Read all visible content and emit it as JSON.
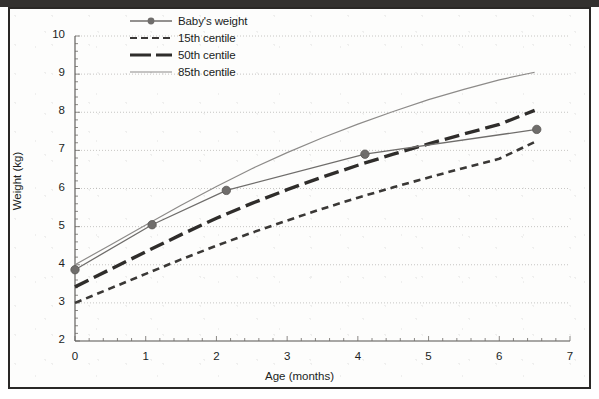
{
  "figure": {
    "frame_color": "#2a2826",
    "background": "#fdfdfc"
  },
  "chart_data": {
    "type": "line",
    "title": "",
    "subtitle": "",
    "xlabel": "Age (months)",
    "ylabel": "Weight (kg)",
    "xlim": [
      0,
      7
    ],
    "ylim": [
      2,
      10
    ],
    "xticks": [
      "0",
      "1",
      "2",
      "3",
      "4",
      "5",
      "6",
      "7"
    ],
    "yticks": [
      "2",
      "3",
      "4",
      "5",
      "6",
      "7",
      "8",
      "9",
      "10"
    ],
    "grid": "horizontal",
    "legend_position": "top-left-inside",
    "series": [
      {
        "name": "Baby's weight",
        "style": "solid-with-markers",
        "color": "#6f6d6b",
        "marker": "filled-circle",
        "x": [
          0.0,
          1.09,
          2.14,
          4.1,
          6.53
        ],
        "y": [
          3.87,
          5.05,
          5.95,
          6.9,
          7.55
        ]
      },
      {
        "name": "15th centile",
        "style": "short-dashed",
        "color": "#3a3836",
        "marker": "none",
        "x": [
          0.0,
          0.5,
          1.0,
          1.5,
          2.0,
          2.5,
          3.0,
          3.5,
          4.0,
          4.5,
          5.0,
          5.5,
          6.0,
          6.5
        ],
        "y": [
          3.0,
          3.38,
          3.76,
          4.14,
          4.5,
          4.84,
          5.16,
          5.47,
          5.76,
          6.03,
          6.29,
          6.54,
          6.78,
          7.22
        ]
      },
      {
        "name": "50th centile",
        "style": "long-dashed",
        "color": "#2f2d2b",
        "marker": "none",
        "x": [
          0.0,
          0.5,
          1.0,
          1.5,
          2.0,
          2.5,
          3.0,
          3.5,
          4.0,
          4.5,
          5.0,
          5.5,
          6.0,
          6.5
        ],
        "y": [
          3.42,
          3.88,
          4.34,
          4.79,
          5.22,
          5.61,
          5.97,
          6.3,
          6.61,
          6.9,
          7.17,
          7.43,
          7.68,
          8.05
        ]
      },
      {
        "name": "85th centile",
        "style": "thin-solid",
        "color": "#8d8b89",
        "marker": "none",
        "x": [
          0.0,
          0.5,
          1.0,
          1.5,
          2.0,
          2.5,
          3.0,
          3.5,
          4.0,
          4.5,
          5.0,
          5.5,
          6.0,
          6.5
        ],
        "y": [
          4.0,
          4.52,
          5.04,
          5.56,
          6.05,
          6.52,
          6.94,
          7.33,
          7.69,
          8.02,
          8.33,
          8.6,
          8.85,
          9.05
        ]
      }
    ]
  },
  "legend": {
    "items": [
      {
        "label": "Baby's weight",
        "swatch": "line-marker-swatch"
      },
      {
        "label": "15th centile",
        "swatch": "short-dash-swatch"
      },
      {
        "label": "50th centile",
        "swatch": "long-dash-swatch"
      },
      {
        "label": "85th centile",
        "swatch": "thin-line-swatch"
      }
    ]
  }
}
